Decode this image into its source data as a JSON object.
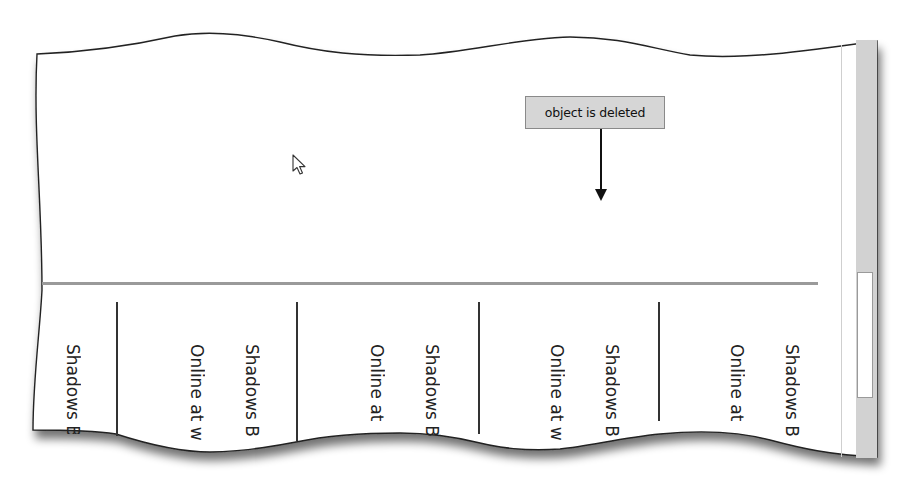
{
  "document": {
    "callout": {
      "label": "object is deleted",
      "fill_color": "#d6d6d6",
      "border_color": "#8a8a8a"
    },
    "pointer": {
      "icon": "mouse-pointer-arrow-icon"
    },
    "report_columns": [
      {
        "label": "Shadows B"
      },
      {
        "label": "Online at w"
      },
      {
        "label": "Shadows B"
      },
      {
        "label": "Online at"
      },
      {
        "label": "Shadows B"
      },
      {
        "label": "Online at w"
      },
      {
        "label": "Shadows B"
      },
      {
        "label": "Online at"
      },
      {
        "label": "Shadows B"
      }
    ],
    "scrollbar": {
      "orientation": "vertical",
      "track_color": "#d2d2d2"
    }
  }
}
